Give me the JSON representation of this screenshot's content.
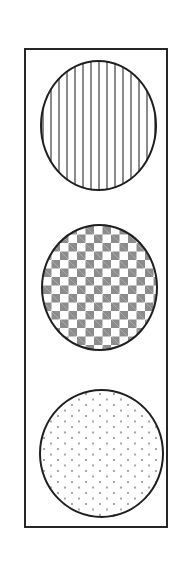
{
  "figure": {
    "canvas": {
      "width_px": 191,
      "height_px": 585,
      "background_color": "#ffffff"
    },
    "housing": {
      "name": "traffic-light-housing",
      "shape": "rectangle",
      "x_px": 24,
      "y_px": 48,
      "width_px": 144,
      "height_px": 480,
      "stroke_color": "#262626",
      "stroke_width_px": 2,
      "fill_color": "#ffffff"
    },
    "lamps": [
      {
        "id": "top",
        "label": "Top lamp",
        "position": "top",
        "shape": "circle",
        "pattern": "vertical-lines",
        "pattern_description": "Vertical line hatch fill",
        "x_px": 38,
        "y_px": 58,
        "width_px": 117,
        "height_px": 131,
        "stroke_color": "#1f1f1f",
        "stroke_width_px": 2,
        "fill_color": "#ffffff",
        "pattern_color": "#8a8a8a",
        "pattern_spacing_px": 8
      },
      {
        "id": "middle",
        "label": "Middle lamp",
        "position": "middle",
        "shape": "circle",
        "pattern": "checkerboard",
        "pattern_description": "Checkerboard square fill",
        "x_px": 39,
        "y_px": 222,
        "width_px": 117,
        "height_px": 127,
        "stroke_color": "#1f1f1f",
        "stroke_width_px": 2,
        "fill_color": "#ffffff",
        "pattern_color": "#8c8c8c",
        "pattern_cell_px": 8.5
      },
      {
        "id": "bottom",
        "label": "Bottom lamp",
        "position": "bottom",
        "shape": "circle",
        "pattern": "dots",
        "pattern_description": "Staggered dot stipple fill",
        "x_px": 37,
        "y_px": 387,
        "width_px": 125,
        "height_px": 129,
        "stroke_color": "#1f1f1f",
        "stroke_width_px": 2,
        "fill_color": "#ffffff",
        "pattern_color": "#a8a8a8",
        "pattern_spacing_x_px": 14,
        "pattern_spacing_y_px": 11
      }
    ]
  }
}
